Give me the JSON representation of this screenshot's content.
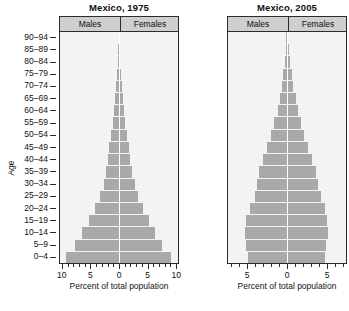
{
  "figure": {
    "y_axis_title": "Age",
    "age_groups": [
      "90–94",
      "85–89",
      "80–84",
      "75–79",
      "70–74",
      "65–69",
      "60–64",
      "55–59",
      "50–54",
      "45–49",
      "40–44",
      "35–39",
      "30–34",
      "25–29",
      "20–24",
      "15–19",
      "10–14",
      "5–9",
      "0–4"
    ],
    "legend": {
      "males": "Males",
      "females": "Females"
    },
    "x_axis_title": "Percent of total population",
    "bar_color": "#a9a9a9",
    "panel_background": "#f3f3f3",
    "header_background": "#cfcfcf",
    "frame_color": "#2b2b2b"
  },
  "chart_data": [
    {
      "type": "bar",
      "subtype": "population-pyramid",
      "title": "Mexico, 1975",
      "xlabel": "Percent of total population",
      "ylabel": "Age",
      "categories": [
        "0–4",
        "5–9",
        "10–14",
        "15–19",
        "20–24",
        "25–29",
        "30–34",
        "35–39",
        "40–44",
        "45–49",
        "50–54",
        "55–59",
        "60–64",
        "65–69",
        "70–74",
        "75–79",
        "80–84",
        "85–89",
        "90–94"
      ],
      "series": [
        {
          "name": "Males",
          "values": [
            9.4,
            7.8,
            6.6,
            5.4,
            4.2,
            3.4,
            2.7,
            2.3,
            2.0,
            1.7,
            1.4,
            1.1,
            0.9,
            0.65,
            0.45,
            0.3,
            0.18,
            0.1,
            0.05
          ]
        },
        {
          "name": "Females",
          "values": [
            9.2,
            7.6,
            6.4,
            5.3,
            4.2,
            3.4,
            2.8,
            2.3,
            2.0,
            1.7,
            1.4,
            1.1,
            0.9,
            0.7,
            0.5,
            0.32,
            0.2,
            0.11,
            0.06
          ]
        }
      ],
      "xtick_labels": [
        "10",
        "5",
        "0",
        "5",
        "10"
      ],
      "xtick_values": [
        -10,
        -5,
        0,
        5,
        10
      ],
      "xlim": [
        -10.5,
        10.5
      ],
      "minor_tick_step": 1,
      "grid": false,
      "legend_position": "top"
    },
    {
      "type": "bar",
      "subtype": "population-pyramid",
      "title": "Mexico, 2005",
      "xlabel": "Percent of total population",
      "ylabel": "Age",
      "categories": [
        "0–4",
        "5–9",
        "10–14",
        "15–19",
        "20–24",
        "25–29",
        "30–34",
        "35–39",
        "40–44",
        "45–49",
        "50–54",
        "55–59",
        "60–64",
        "65–69",
        "70–74",
        "75–79",
        "80–84",
        "85–89",
        "90–94"
      ],
      "series": [
        {
          "name": "Males",
          "values": [
            5.0,
            5.2,
            5.4,
            5.2,
            4.7,
            4.1,
            3.8,
            3.5,
            3.0,
            2.5,
            2.0,
            1.6,
            1.2,
            0.95,
            0.7,
            0.5,
            0.3,
            0.15,
            0.07
          ]
        },
        {
          "name": "Females",
          "values": [
            4.8,
            5.0,
            5.2,
            5.1,
            4.8,
            4.3,
            4.0,
            3.7,
            3.2,
            2.7,
            2.2,
            1.8,
            1.4,
            1.1,
            0.8,
            0.58,
            0.38,
            0.2,
            0.09
          ]
        }
      ],
      "xtick_labels": [
        "5",
        "0",
        "5"
      ],
      "xtick_values": [
        -5,
        0,
        5
      ],
      "xlim": [
        -7.5,
        7.5
      ],
      "minor_tick_step": 1,
      "grid": false,
      "legend_position": "top"
    }
  ]
}
